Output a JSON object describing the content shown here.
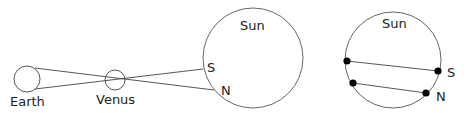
{
  "diagram": {
    "left_panel": {
      "earth_label": "Earth",
      "venus_label": "Venus",
      "sun_label": "Sun",
      "south_label": "S",
      "north_label": "N"
    },
    "right_panel": {
      "sun_label": "Sun",
      "south_label": "S",
      "north_label": "N",
      "transit_paths": [
        {
          "name": "south-observer-path",
          "start": [
            347,
            61
          ],
          "end": [
            438,
            71
          ]
        },
        {
          "name": "north-observer-path",
          "start": [
            353,
            83
          ],
          "end": [
            426,
            93
          ]
        }
      ]
    },
    "colors": {
      "stroke": "#444444",
      "dot": "#000000",
      "text": "#222222"
    }
  }
}
